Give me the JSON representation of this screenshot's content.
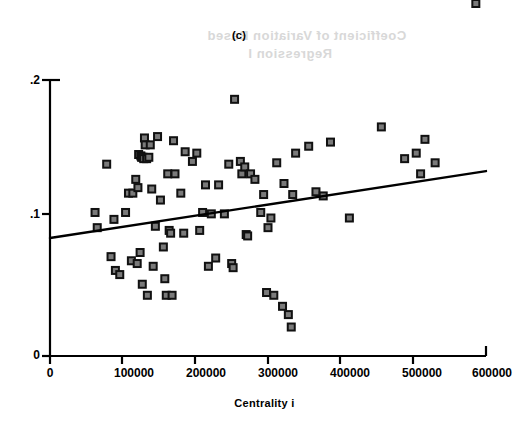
{
  "figure": {
    "panel_label": "(c)",
    "xlabel": "Centrality  i",
    "ylabel_symbol": "δ",
    "ylabel_hat": "ˆ",
    "ylabel_sub": "i",
    "ylabel_paren": "(Centrality)",
    "background_showthrough_line1": "Coefficient of Variation Based",
    "background_showthrough_line2": "Regression I",
    "marker_fill": "#7a7a7a",
    "marker_stroke": "#111111",
    "line_color": "#000000",
    "axis_color": "#000000"
  },
  "axes": {
    "x_ticks": [
      "0",
      "100000",
      "200000",
      "300000",
      "400000",
      "500000",
      "600000"
    ],
    "x_tick_values": [
      0,
      100000,
      200000,
      300000,
      400000,
      500000,
      600000
    ],
    "y_ticks": [
      ".2",
      ".1",
      "0"
    ],
    "y_tick_values": [
      0.2,
      0.1,
      0.0
    ],
    "xlim": [
      0,
      600000
    ],
    "ylim": [
      0,
      0.2
    ],
    "grid": false
  },
  "chart_data": {
    "type": "scatter",
    "title": "(c)",
    "xlabel": "Centrality i",
    "ylabel": "δ̂i (Centrality)",
    "xlim": [
      0,
      600000
    ],
    "ylim": [
      0,
      0.2
    ],
    "grid": false,
    "legend": null,
    "x": [
      62000,
      65000,
      78000,
      84000,
      88000,
      90000,
      96000,
      104000,
      108000,
      112000,
      114000,
      118000,
      120000,
      121000,
      122000,
      124000,
      125000,
      126000,
      127000,
      128000,
      129000,
      130000,
      131000,
      133000,
      134000,
      136000,
      138000,
      140000,
      142000,
      145000,
      148000,
      152000,
      156000,
      158000,
      160000,
      162000,
      164000,
      166000,
      168000,
      170000,
      172000,
      180000,
      184000,
      186000,
      196000,
      202000,
      206000,
      210000,
      214000,
      218000,
      222000,
      228000,
      232000,
      240000,
      246000,
      250000,
      252000,
      254000,
      262000,
      264000,
      268000,
      270000,
      272000,
      276000,
      282000,
      290000,
      294000,
      298000,
      300000,
      304000,
      308000,
      312000,
      320000,
      322000,
      328000,
      332000,
      334000,
      338000,
      356000,
      366000,
      376000,
      386000,
      412000,
      456000,
      488000,
      504000,
      510000,
      516000,
      530000,
      586000
    ],
    "y": [
      0.104,
      0.093,
      0.139,
      0.072,
      0.099,
      0.062,
      0.059,
      0.104,
      0.118,
      0.069,
      0.118,
      0.128,
      0.067,
      0.122,
      0.146,
      0.075,
      0.145,
      0.144,
      0.052,
      0.144,
      0.143,
      0.158,
      0.153,
      0.143,
      0.044,
      0.144,
      0.153,
      0.121,
      0.065,
      0.094,
      0.159,
      0.113,
      0.079,
      0.056,
      0.044,
      0.132,
      0.091,
      0.089,
      0.044,
      0.156,
      0.132,
      0.118,
      0.089,
      0.148,
      0.141,
      0.147,
      0.091,
      0.104,
      0.124,
      0.065,
      0.103,
      0.071,
      0.124,
      0.103,
      0.139,
      0.067,
      0.064,
      0.186,
      0.141,
      0.132,
      0.137,
      0.088,
      0.087,
      0.132,
      0.128,
      0.104,
      0.117,
      0.046,
      0.093,
      0.1,
      0.044,
      0.14,
      0.036,
      0.125,
      0.03,
      0.021,
      0.117,
      0.147,
      0.152,
      0.119,
      0.116,
      0.155,
      0.1,
      0.166,
      0.143,
      0.147,
      0.132,
      0.157,
      0.14
    ],
    "trend_line": {
      "type": "linear",
      "x_start": 0,
      "y_start": 0.0855,
      "x_end": 600000,
      "y_end": 0.134
    }
  }
}
